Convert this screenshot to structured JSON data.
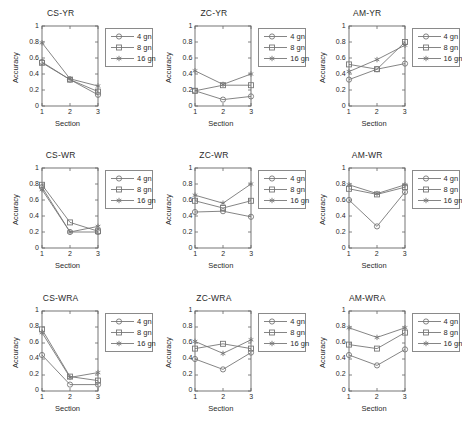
{
  "figure": {
    "rows": 3,
    "cols": 3,
    "background": "#ffffff",
    "line_color": "#777777",
    "axis_color": "#666666",
    "text_color": "#2a2a2a"
  },
  "legend": {
    "entries": [
      {
        "label": "4 gn",
        "marker": "circle"
      },
      {
        "label": "8 gn",
        "marker": "square"
      },
      {
        "label": "16 gn",
        "marker": "asterisk"
      }
    ],
    "position": "top-right-outside"
  },
  "axes_common": {
    "xlabel": "Section",
    "ylabel": "Accuracy",
    "xticks": [
      "1",
      "2",
      "3"
    ],
    "yticks": [
      "0",
      "0.2",
      "0.4",
      "0.6",
      "0.8",
      "1"
    ],
    "xlim": [
      1,
      3
    ],
    "ylim": [
      0,
      1
    ],
    "grid": false
  },
  "chart_data": [
    {
      "type": "line",
      "title": "CS-YR",
      "xlabel": "Section",
      "ylabel": "Accuracy",
      "categories": [
        "1",
        "2",
        "3"
      ],
      "x": [
        1,
        2,
        3
      ],
      "xlim": [
        1,
        3
      ],
      "ylim": [
        0,
        1
      ],
      "grid": false,
      "series": [
        {
          "name": "4 gn",
          "marker": "circle",
          "values": [
            0.55,
            0.33,
            0.14
          ]
        },
        {
          "name": "8 gn",
          "marker": "square",
          "values": [
            0.54,
            0.33,
            0.18
          ]
        },
        {
          "name": "16 gn",
          "marker": "asterisk",
          "values": [
            0.79,
            0.34,
            0.25
          ]
        }
      ]
    },
    {
      "type": "line",
      "title": "ZC-YR",
      "xlabel": "Section",
      "ylabel": "Accuracy",
      "categories": [
        "1",
        "2",
        "3"
      ],
      "x": [
        1,
        2,
        3
      ],
      "xlim": [
        1,
        3
      ],
      "ylim": [
        0,
        1
      ],
      "grid": false,
      "series": [
        {
          "name": "4 gn",
          "marker": "circle",
          "values": [
            0.19,
            0.08,
            0.12
          ]
        },
        {
          "name": "8 gn",
          "marker": "square",
          "values": [
            0.19,
            0.26,
            0.26
          ]
        },
        {
          "name": "16 gn",
          "marker": "asterisk",
          "values": [
            0.44,
            0.27,
            0.4
          ]
        }
      ]
    },
    {
      "type": "line",
      "title": "AM-YR",
      "xlabel": "Section",
      "ylabel": "Accuracy",
      "categories": [
        "1",
        "2",
        "3"
      ],
      "x": [
        1,
        2,
        3
      ],
      "xlim": [
        1,
        3
      ],
      "ylim": [
        0,
        1
      ],
      "grid": false,
      "series": [
        {
          "name": "4 gn",
          "marker": "circle",
          "values": [
            0.33,
            0.46,
            0.53
          ]
        },
        {
          "name": "8 gn",
          "marker": "square",
          "values": [
            0.52,
            0.46,
            0.8
          ]
        },
        {
          "name": "16 gn",
          "marker": "asterisk",
          "values": [
            0.43,
            0.58,
            0.76
          ]
        }
      ]
    },
    {
      "type": "line",
      "title": "CS-WR",
      "xlabel": "Section",
      "ylabel": "Accuracy",
      "categories": [
        "1",
        "2",
        "3"
      ],
      "x": [
        1,
        2,
        3
      ],
      "xlim": [
        1,
        3
      ],
      "ylim": [
        0,
        1
      ],
      "grid": false,
      "series": [
        {
          "name": "4 gn",
          "marker": "circle",
          "values": [
            0.76,
            0.2,
            0.2
          ]
        },
        {
          "name": "8 gn",
          "marker": "square",
          "values": [
            0.79,
            0.32,
            0.21
          ]
        },
        {
          "name": "16 gn",
          "marker": "asterisk",
          "values": [
            0.73,
            0.2,
            0.27
          ]
        }
      ]
    },
    {
      "type": "line",
      "title": "ZC-WR",
      "xlabel": "Section",
      "ylabel": "Accuracy",
      "categories": [
        "1",
        "2",
        "3"
      ],
      "x": [
        1,
        2,
        3
      ],
      "xlim": [
        1,
        3
      ],
      "ylim": [
        0,
        1
      ],
      "grid": false,
      "series": [
        {
          "name": "4 gn",
          "marker": "circle",
          "values": [
            0.45,
            0.46,
            0.39
          ]
        },
        {
          "name": "8 gn",
          "marker": "square",
          "values": [
            0.59,
            0.5,
            0.59
          ]
        },
        {
          "name": "16 gn",
          "marker": "asterisk",
          "values": [
            0.66,
            0.56,
            0.8
          ]
        }
      ]
    },
    {
      "type": "line",
      "title": "AM-WR",
      "xlabel": "Section",
      "ylabel": "Accuracy",
      "categories": [
        "1",
        "2",
        "3"
      ],
      "x": [
        1,
        2,
        3
      ],
      "xlim": [
        1,
        3
      ],
      "ylim": [
        0,
        1
      ],
      "grid": false,
      "series": [
        {
          "name": "4 gn",
          "marker": "circle",
          "values": [
            0.6,
            0.27,
            0.7
          ]
        },
        {
          "name": "8 gn",
          "marker": "square",
          "values": [
            0.74,
            0.67,
            0.76
          ]
        },
        {
          "name": "16 gn",
          "marker": "asterisk",
          "values": [
            0.79,
            0.68,
            0.79
          ]
        }
      ]
    },
    {
      "type": "line",
      "title": "CS-WRA",
      "xlabel": "Section",
      "ylabel": "Accuracy",
      "categories": [
        "1",
        "2",
        "3"
      ],
      "x": [
        1,
        2,
        3
      ],
      "xlim": [
        1,
        3
      ],
      "ylim": [
        0,
        1
      ],
      "grid": false,
      "series": [
        {
          "name": "4 gn",
          "marker": "circle",
          "values": [
            0.45,
            0.08,
            0.08
          ]
        },
        {
          "name": "8 gn",
          "marker": "square",
          "values": [
            0.77,
            0.18,
            0.13
          ]
        },
        {
          "name": "16 gn",
          "marker": "asterisk",
          "values": [
            0.73,
            0.17,
            0.23
          ]
        }
      ]
    },
    {
      "type": "line",
      "title": "ZC-WRA",
      "xlabel": "Section",
      "ylabel": "Accuracy",
      "categories": [
        "1",
        "2",
        "3"
      ],
      "x": [
        1,
        2,
        3
      ],
      "xlim": [
        1,
        3
      ],
      "ylim": [
        0,
        1
      ],
      "grid": false,
      "series": [
        {
          "name": "4 gn",
          "marker": "circle",
          "values": [
            0.4,
            0.27,
            0.48
          ]
        },
        {
          "name": "8 gn",
          "marker": "square",
          "values": [
            0.53,
            0.59,
            0.53
          ]
        },
        {
          "name": "16 gn",
          "marker": "asterisk",
          "values": [
            0.62,
            0.47,
            0.64
          ]
        }
      ]
    },
    {
      "type": "line",
      "title": "AM-WRA",
      "xlabel": "Section",
      "ylabel": "Accuracy",
      "categories": [
        "1",
        "2",
        "3"
      ],
      "x": [
        1,
        2,
        3
      ],
      "xlim": [
        1,
        3
      ],
      "ylim": [
        0,
        1
      ],
      "grid": false,
      "series": [
        {
          "name": "4 gn",
          "marker": "circle",
          "values": [
            0.45,
            0.32,
            0.52
          ]
        },
        {
          "name": "8 gn",
          "marker": "square",
          "values": [
            0.58,
            0.53,
            0.73
          ]
        },
        {
          "name": "16 gn",
          "marker": "asterisk",
          "values": [
            0.79,
            0.67,
            0.79
          ]
        }
      ]
    }
  ]
}
